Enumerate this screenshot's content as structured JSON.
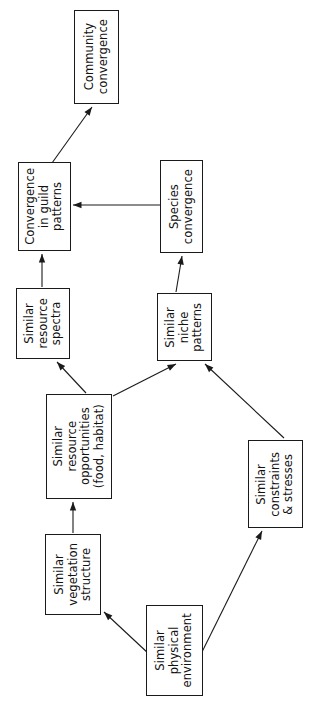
{
  "diagram": {
    "orientation": "text rotated 90 degrees counter-clockwise",
    "background_color": "#ffffff",
    "line_color": "#1a1a1a",
    "text_color": "#111111",
    "nodes": [
      {
        "id": "community-convergence",
        "lines": [
          "Community",
          "convergence"
        ],
        "x": 74,
        "y": 10,
        "w": 45,
        "h": 94,
        "font_size": 11.5
      },
      {
        "id": "convergence-in-guild-patterns",
        "lines": [
          "Convergence",
          "in guild",
          "patterns"
        ],
        "x": 18,
        "y": 162,
        "w": 53,
        "h": 89,
        "font_size": 11.5
      },
      {
        "id": "species-convergence",
        "lines": [
          "Species",
          "convergence"
        ],
        "x": 160,
        "y": 160,
        "w": 43,
        "h": 93,
        "font_size": 11.5
      },
      {
        "id": "similar-resource-spectra",
        "lines": [
          "Similar",
          "resource",
          "spectra"
        ],
        "x": 16,
        "y": 288,
        "w": 54,
        "h": 71,
        "font_size": 11.5
      },
      {
        "id": "similar-niche-patterns",
        "lines": [
          "Similar",
          "niche",
          "patterns"
        ],
        "x": 157,
        "y": 293,
        "w": 55,
        "h": 68,
        "font_size": 11.5
      },
      {
        "id": "similar-resource-opportunities",
        "lines": [
          "Similar",
          "resource",
          "opportunities",
          "(food, habitat)"
        ],
        "x": 46,
        "y": 394,
        "w": 66,
        "h": 105,
        "font_size": 11.5
      },
      {
        "id": "similar-constraints-stresses",
        "lines": [
          "Similar",
          "constraints",
          "& stresses"
        ],
        "x": 248,
        "y": 440,
        "w": 55,
        "h": 88,
        "font_size": 11.5
      },
      {
        "id": "similar-vegetation-structure",
        "lines": [
          "Similar",
          "vegetation",
          "structure"
        ],
        "x": 45,
        "y": 534,
        "w": 56,
        "h": 81,
        "font_size": 11.5
      },
      {
        "id": "similar-physical-environment",
        "lines": [
          "Similar",
          "physical",
          "environment"
        ],
        "x": 146,
        "y": 605,
        "w": 57,
        "h": 91,
        "font_size": 11.5
      }
    ],
    "edges": [
      {
        "id": "edge-guild-to-community",
        "from": "convergence-in-guild-patterns",
        "to": "community-convergence",
        "x1": 52,
        "y1": 163,
        "x2": 92,
        "y2": 107,
        "arrowhead": true
      },
      {
        "id": "edge-species-to-guild",
        "from": "species-convergence",
        "to": "convergence-in-guild-patterns",
        "x1": 160,
        "y1": 205,
        "x2": 73,
        "y2": 205,
        "arrowhead": true
      },
      {
        "id": "edge-spectra-to-guild",
        "from": "similar-resource-spectra",
        "to": "convergence-in-guild-patterns",
        "x1": 42,
        "y1": 287,
        "x2": 42,
        "y2": 254,
        "arrowhead": true
      },
      {
        "id": "edge-niche-to-species",
        "from": "similar-niche-patterns",
        "to": "species-convergence",
        "x1": 176,
        "y1": 292,
        "x2": 182,
        "y2": 256,
        "arrowhead": true
      },
      {
        "id": "edge-opportunities-to-spectra",
        "from": "similar-resource-opportunities",
        "to": "similar-resource-spectra",
        "x1": 86,
        "y1": 393,
        "x2": 57,
        "y2": 362,
        "arrowhead": true
      },
      {
        "id": "edge-opportunities-to-niche",
        "from": "similar-resource-opportunities",
        "to": "similar-niche-patterns",
        "x1": 113,
        "y1": 396,
        "x2": 176,
        "y2": 364,
        "arrowhead": true
      },
      {
        "id": "edge-constraints-to-niche",
        "from": "similar-constraints-stresses",
        "to": "similar-niche-patterns",
        "x1": 284,
        "y1": 438,
        "x2": 205,
        "y2": 364,
        "arrowhead": true
      },
      {
        "id": "edge-vegetation-to-opportunities",
        "from": "similar-vegetation-structure",
        "to": "similar-resource-opportunities",
        "x1": 73,
        "y1": 533,
        "x2": 73,
        "y2": 502,
        "arrowhead": true
      },
      {
        "id": "edge-physical-to-vegetation",
        "from": "similar-physical-environment",
        "to": "similar-vegetation-structure",
        "x1": 149,
        "y1": 654,
        "x2": 104,
        "y2": 612,
        "arrowhead": true
      },
      {
        "id": "edge-physical-to-constraints",
        "from": "similar-physical-environment",
        "to": "similar-constraints-stresses",
        "x1": 201,
        "y1": 654,
        "x2": 262,
        "y2": 531,
        "arrowhead": true
      }
    ]
  }
}
